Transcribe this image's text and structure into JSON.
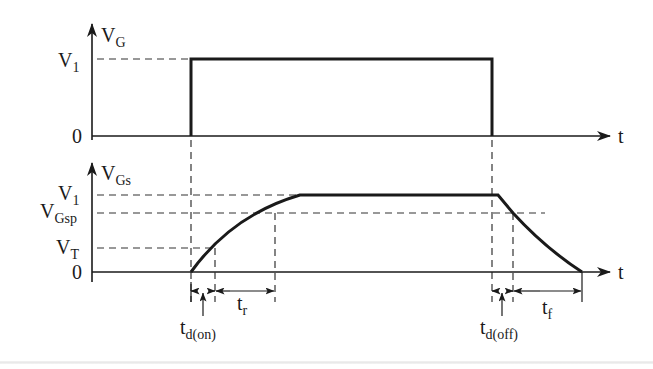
{
  "diagram": {
    "type": "mosfet-gate-switching-timing",
    "top_plot": {
      "y_axis_label": "V",
      "y_axis_label_sub": "G",
      "x_axis_label": "t",
      "levels": [
        {
          "label": "V",
          "sub": "1"
        },
        {
          "label": "0",
          "sub": ""
        }
      ],
      "waveform": "rectangular pulse from 0 to V1"
    },
    "bottom_plot": {
      "y_axis_label": "V",
      "y_axis_label_sub": "Gs",
      "x_axis_label": "t",
      "levels": [
        {
          "label": "V",
          "sub": "1"
        },
        {
          "label": "V",
          "sub": "Gsp"
        },
        {
          "label": "V",
          "sub": "T"
        },
        {
          "label": "0",
          "sub": ""
        }
      ],
      "waveform": "rising curve to V1, flat, then falling ramp to 0"
    },
    "intervals": [
      {
        "label": "t",
        "sub": "d(on)"
      },
      {
        "label": "t",
        "sub": "r"
      },
      {
        "label": "t",
        "sub": "d(off)"
      },
      {
        "label": "t",
        "sub": "f"
      }
    ]
  }
}
